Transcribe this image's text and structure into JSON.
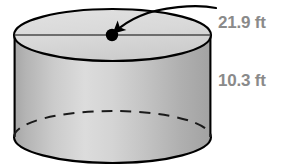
{
  "figure": {
    "type": "cylinder-geometry-diagram",
    "shape_name": "cylinder",
    "background_color": "#ffffff",
    "outline_color": "#000000",
    "label_color": "#8a8a8a",
    "top_face_fill": "#d9d9d9",
    "body_fill_light": "#dcdcdc",
    "body_fill_dark": "#a9a9a9"
  },
  "labels": {
    "diameter": "21.9 ft",
    "height": "10.3 ft"
  },
  "measurements": [
    {
      "name": "diameter",
      "value": 21.9,
      "unit": "ft",
      "text": "21.9 ft"
    },
    {
      "name": "height",
      "value": 10.3,
      "unit": "ft",
      "text": "10.3 ft"
    }
  ],
  "annotations": {
    "center_point_label": "center-point-dot",
    "leader_arrow_label": "diameter-leader-arrow",
    "diameter_line_label": "diameter-line",
    "hidden_edge_label": "hidden-bottom-edge-dashed"
  },
  "geometry": {
    "left_x": 14,
    "right_x": 211,
    "top_center_y": 35,
    "bottom_center_y": 137,
    "ellipse_rx": 98.5,
    "ellipse_ry": 26,
    "center_dot_x": 112,
    "center_dot_y": 35
  }
}
